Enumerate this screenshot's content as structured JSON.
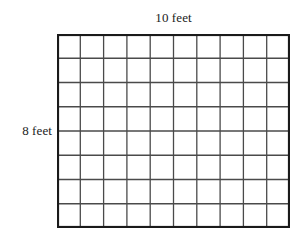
{
  "figure": {
    "type": "area-model-grid",
    "top_label": "10 feet",
    "left_label": "8 feet",
    "background_color": "#ffffff"
  },
  "chart_data": {
    "type": "table",
    "title": "",
    "xlabel": "10 feet",
    "ylabel": "8 feet",
    "columns": 10,
    "rows": 8,
    "total_cells": 80,
    "unit": "feet",
    "width_value": 10,
    "height_value": 8,
    "area_value": 80,
    "grid": true,
    "legend": "none",
    "colors": {
      "outer_border": "#1a1a1a",
      "inner_line": "#4a4a4a",
      "cell_fill": "#ffffff",
      "text": "#1c1c1c"
    }
  }
}
